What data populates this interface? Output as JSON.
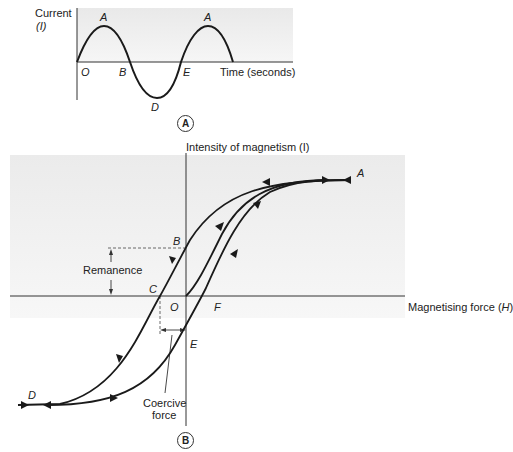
{
  "panel_a": {
    "badge": "A",
    "y_axis_label_line1": "Current",
    "y_axis_label_line2": "(I)",
    "x_axis_label": "Time (seconds)",
    "points": {
      "origin": "O",
      "peak1": "A",
      "zero1": "B",
      "trough": "D",
      "zero2": "E",
      "peak2": "A"
    }
  },
  "panel_b": {
    "badge": "B",
    "y_axis_label": "Intensity of magnetism (I)",
    "x_axis_label_prefix": "Magnetising force (",
    "x_axis_label_var": "H",
    "x_axis_label_suffix": ")",
    "points": {
      "saturation_pos": "A",
      "remanence_pt": "B",
      "coercive_pt": "C",
      "origin": "O",
      "saturation_neg": "D",
      "neg_remanence_pt": "E",
      "coercive_pos_pt": "F"
    },
    "annotations": {
      "remanence": "Remanence",
      "coercive_line1": "Coercive",
      "coercive_line2": "force"
    }
  },
  "colors": {
    "curve": "#1a1a1a",
    "shade": "#efefef",
    "axis": "#333333"
  }
}
